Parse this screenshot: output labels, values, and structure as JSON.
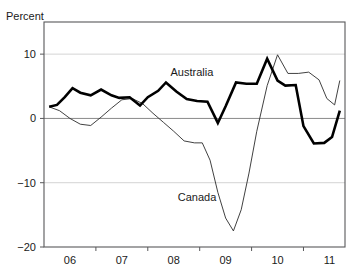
{
  "chart_data": {
    "type": "line",
    "title": "",
    "subtitle": "",
    "xlabel": "",
    "ylabel": "Percent",
    "unit_label": "Percent",
    "ylim": [
      -20,
      15
    ],
    "xlim": [
      2005.5,
      2011.3
    ],
    "yticks": [
      10,
      0,
      -10,
      -20
    ],
    "ytick_labels": [
      "10",
      "0",
      "−10",
      "−20"
    ],
    "xticks": [
      2006,
      2007,
      2008,
      2009,
      2010,
      2011
    ],
    "xtick_labels": [
      "06",
      "07",
      "08",
      "09",
      "10",
      "11"
    ],
    "grid": "horizontal gridlines at 10 and -10; zero line emphasized",
    "legend_position": "inline annotations on plot",
    "annotations": [
      {
        "text": "Australia",
        "x": 2008.35,
        "y": 6.6
      },
      {
        "text": "Canada",
        "x": 2008.45,
        "y": -12.8
      }
    ],
    "series": [
      {
        "name": "Australia",
        "style": "bold-black",
        "x": [
          2005.6,
          2005.75,
          2005.9,
          2006.05,
          2006.2,
          2006.4,
          2006.6,
          2006.8,
          2006.95,
          2007.15,
          2007.35,
          2007.5,
          2007.7,
          2007.85,
          2008.05,
          2008.25,
          2008.45,
          2008.65,
          2008.85,
          2009.0,
          2009.2,
          2009.4,
          2009.6,
          2009.8,
          2010.0,
          2010.15,
          2010.35,
          2010.5,
          2010.7,
          2010.9,
          2011.05,
          2011.2
        ],
        "values": [
          1.8,
          2.1,
          3.3,
          4.7,
          4.0,
          3.6,
          4.5,
          3.6,
          3.2,
          3.3,
          2.0,
          3.3,
          4.3,
          5.6,
          4.2,
          3.0,
          2.7,
          2.6,
          -0.7,
          1.9,
          5.6,
          5.4,
          5.4,
          9.3,
          5.9,
          5.1,
          5.2,
          -1.2,
          -3.9,
          -3.8,
          -2.9,
          1.2
        ]
      },
      {
        "name": "Canada",
        "style": "thin-black",
        "x": [
          2005.6,
          2005.8,
          2006.0,
          2006.2,
          2006.4,
          2006.6,
          2006.8,
          2007.0,
          2007.2,
          2007.4,
          2007.6,
          2007.8,
          2008.0,
          2008.2,
          2008.4,
          2008.55,
          2008.7,
          2008.85,
          2009.0,
          2009.15,
          2009.3,
          2009.45,
          2009.6,
          2009.8,
          2010.0,
          2010.2,
          2010.4,
          2010.6,
          2010.8,
          2010.95,
          2011.1,
          2011.2
        ],
        "values": [
          1.8,
          1.2,
          0.0,
          -0.9,
          -1.1,
          0.2,
          1.6,
          2.9,
          3.1,
          2.3,
          0.8,
          -0.6,
          -2.0,
          -3.5,
          -3.8,
          -3.8,
          -6.5,
          -11.5,
          -15.5,
          -17.5,
          -14.2,
          -8.5,
          -2.0,
          5.1,
          9.9,
          7.0,
          7.0,
          7.2,
          6.0,
          3.1,
          2.1,
          5.9
        ]
      }
    ]
  },
  "geometry": {
    "plot_left": 44,
    "plot_right": 345,
    "plot_top": 22,
    "plot_bottom": 247,
    "y_value_top": 15,
    "y_value_bottom": -20,
    "x_value_left": 2005.5,
    "x_value_right": 2011.3
  }
}
